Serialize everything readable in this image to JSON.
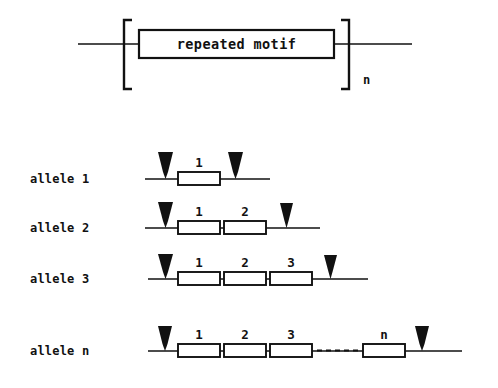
{
  "figure": {
    "background_color": "#ffffff",
    "ink_color": "#111111",
    "top_diagram": {
      "motif_box_label": "repeated motif",
      "repeat_count_label": "n",
      "bracket_left": "[",
      "bracket_right": "]",
      "flank_left_label": "",
      "flank_right_label": ""
    },
    "alleles": [
      {
        "label": "allele 1",
        "repeat_count": 1,
        "unit_labels": [
          "1"
        ],
        "has_dashed_gap": false,
        "arrows": [
          "left",
          "right"
        ]
      },
      {
        "label": "allele 2",
        "repeat_count": 2,
        "unit_labels": [
          "1",
          "2"
        ],
        "has_dashed_gap": false,
        "arrows": [
          "left",
          "right"
        ]
      },
      {
        "label": "allele 3",
        "repeat_count": 3,
        "unit_labels": [
          "1",
          "2",
          "3"
        ],
        "has_dashed_gap": false,
        "arrows": [
          "left",
          "right"
        ]
      },
      {
        "label": "allele n",
        "repeat_count": "n",
        "unit_labels": [
          "1",
          "2",
          "3",
          "n"
        ],
        "has_dashed_gap": true,
        "arrows": [
          "left",
          "right"
        ]
      }
    ]
  }
}
